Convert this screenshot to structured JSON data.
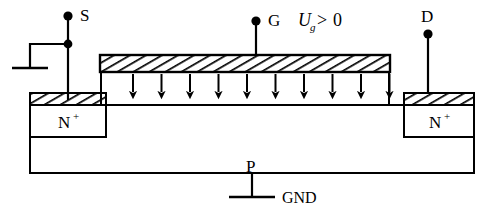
{
  "figure": {
    "kind": "mosfet-cross-section-diagram",
    "background_color": "#ffffff",
    "line_color": "#000000"
  },
  "terminals": {
    "source": {
      "label": "S",
      "dot_x": 68,
      "dot_y": 17,
      "lead_bottom_y": 100
    },
    "gate": {
      "label": "G",
      "dot_x": 256,
      "dot_y": 21,
      "lead_bottom_y": 55
    },
    "drain": {
      "label": "D",
      "dot_x": 428,
      "dot_y": 34,
      "lead_bottom_y": 95
    }
  },
  "labels": {
    "gate_voltage": {
      "symbol": "U",
      "subscript": "g",
      "operator": ">",
      "value": "0"
    },
    "source_region": {
      "base": "N",
      "superscript": "+"
    },
    "drain_region": {
      "base": "N",
      "superscript": "+"
    },
    "substrate": "P",
    "ground": "GND"
  },
  "structure": {
    "substrate_label": "P",
    "oxide_hatch_angle_deg": 60,
    "field_arrow_count": 10,
    "field_arrow_first_x": 133,
    "field_arrow_spacing": 28.5,
    "field_arrow_top_y": 74,
    "field_arrow_bottom_y": 100,
    "gate_bar": {
      "x": 100,
      "y": 55,
      "width": 290,
      "height": 17
    },
    "source_contact": {
      "x": 30,
      "y": 93,
      "width": 76,
      "height": 12
    },
    "drain_contact": {
      "x": 404,
      "y": 93,
      "width": 70,
      "height": 12
    },
    "source_nplus": {
      "x": 30,
      "y": 105,
      "width": 76,
      "height": 32
    },
    "drain_nplus": {
      "x": 404,
      "y": 105,
      "width": 70,
      "height": 32
    },
    "substrate_body": {
      "x": 30,
      "y": 105,
      "width": 444,
      "height": 68
    },
    "channel_surface_y": 105
  }
}
